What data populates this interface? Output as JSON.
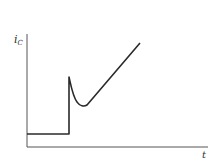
{
  "figure": {
    "y_label": {
      "main": "i",
      "sub": "C"
    },
    "x_label": "t",
    "colors": {
      "line": "#2a2a2a",
      "axis": "#555555",
      "background": "#ffffff"
    },
    "axes": {
      "origin": [
        27,
        147
      ],
      "y_axis_top": [
        27,
        34
      ],
      "x_axis_right": [
        208,
        147
      ]
    },
    "curve_path": "M27,134 L69,134 L69,77 C71,86 73,97 77,102 C80,106 84,107 87,105 L140,43"
  }
}
